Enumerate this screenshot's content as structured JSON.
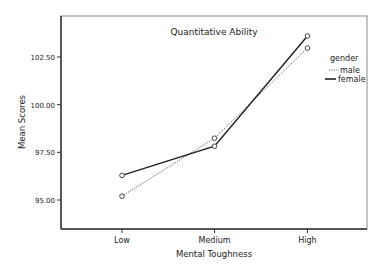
{
  "chart_data": {
    "type": "line",
    "title": "Quantitative Ability",
    "xlabel": "Mental Toughness",
    "ylabel": "Mean Scores",
    "categories": [
      "Low",
      "Medium",
      "High"
    ],
    "y_ticks": [
      "95.00",
      "97.50",
      "100.00",
      "102.50"
    ],
    "y_tick_values": [
      95.0,
      97.5,
      100.0,
      102.5
    ],
    "ylim": [
      93.5,
      104.6
    ],
    "grid": false,
    "legend": {
      "title": "gender",
      "position": "right",
      "entries": [
        "male",
        "female"
      ]
    },
    "series": [
      {
        "name": "male",
        "style": "dotted",
        "values": [
          95.2,
          98.24,
          102.97
        ]
      },
      {
        "name": "female",
        "style": "solid",
        "values": [
          96.29,
          97.82,
          103.6
        ]
      }
    ]
  }
}
